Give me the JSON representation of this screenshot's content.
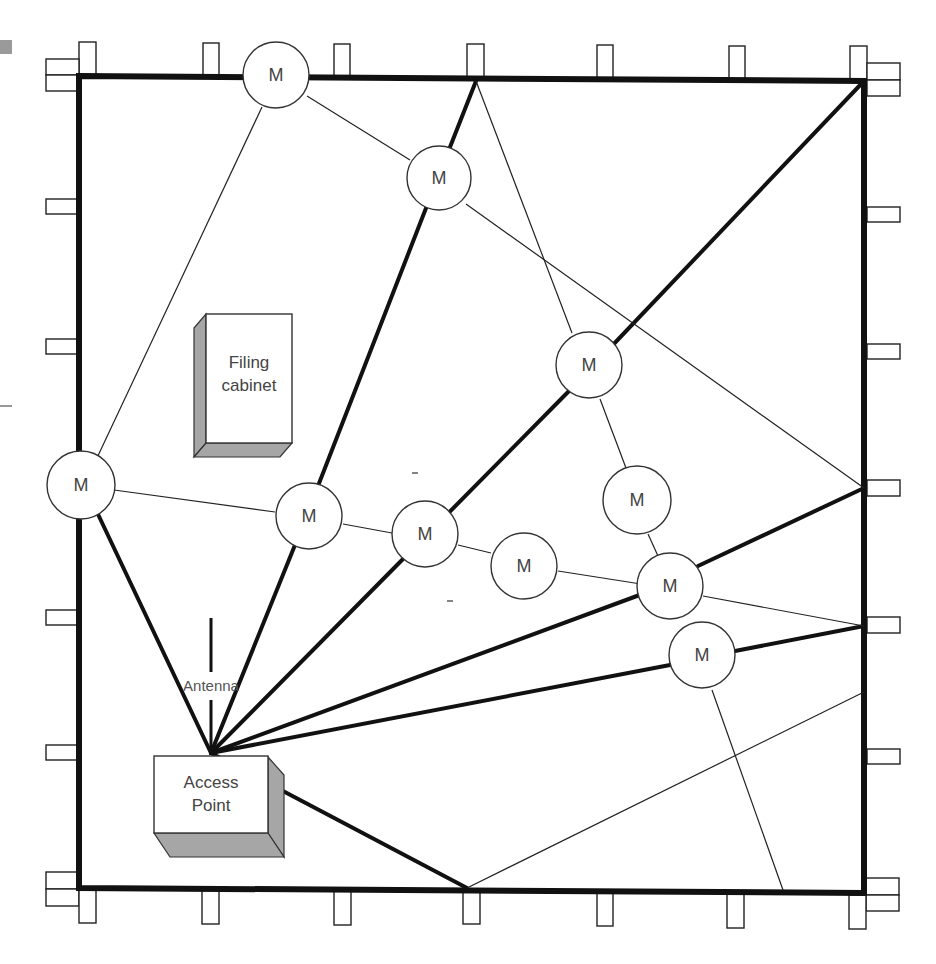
{
  "diagram": {
    "node_label": "M",
    "nodes": [
      {
        "id": "m1",
        "label": "M",
        "x": 276,
        "y": 75
      },
      {
        "id": "m2",
        "label": "M",
        "x": 439,
        "y": 178
      },
      {
        "id": "m3",
        "label": "M",
        "x": 589,
        "y": 365
      },
      {
        "id": "m4",
        "label": "M",
        "x": 81,
        "y": 485
      },
      {
        "id": "m5",
        "label": "M",
        "x": 309,
        "y": 516
      },
      {
        "id": "m6",
        "label": "M",
        "x": 425,
        "y": 534
      },
      {
        "id": "m7",
        "label": "M",
        "x": 637,
        "y": 500
      },
      {
        "id": "m8",
        "label": "M",
        "x": 524,
        "y": 566
      },
      {
        "id": "m9",
        "label": "M",
        "x": 670,
        "y": 586
      },
      {
        "id": "m10",
        "label": "M",
        "x": 702,
        "y": 655
      }
    ],
    "filing_cabinet": {
      "label_line1": "Filing",
      "label_line2": "cabinet"
    },
    "access_point": {
      "label_line1": "Access",
      "label_line2": "Point"
    },
    "antenna": {
      "label": "Antenna"
    }
  },
  "colors": {
    "background": "#ffffff",
    "lines": "#111111",
    "box_shade": "#a6a6a6",
    "text": "#444444"
  }
}
